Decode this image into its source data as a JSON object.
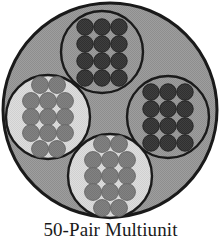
{
  "figure": {
    "caption": "50-Pair Multiunit"
  },
  "colors": {
    "page_background": "#ffffff",
    "outline": "#1a1a1a",
    "jacket_fill": "#9a9a9a",
    "bundle_fill_dark": "#9a9a9a",
    "bundle_fill_light": "#d9d9d9",
    "conductor_dark": "#3c3c3c",
    "conductor_medium": "#7e7e7e",
    "caption_text": "#1a1a1a"
  },
  "cable": {
    "label": "cable-cross-section",
    "outer": {
      "cx": 110,
      "cy": 110,
      "r": 107,
      "stroke_width": 3
    },
    "bundle_count": 4,
    "bundles": [
      {
        "name": "top-bundle",
        "position": "top",
        "cx": 102,
        "cy": 52,
        "r": 41,
        "fill": "#9a9a9a",
        "dot_fill": "#3c3c3c",
        "dot_r": 8.2,
        "columns": 3,
        "rows": 4,
        "dot_count": 12,
        "dots": [
          [
            -17,
            -25
          ],
          [
            0,
            -25
          ],
          [
            17,
            -25
          ],
          [
            -17,
            -8
          ],
          [
            0,
            -8
          ],
          [
            17,
            -8
          ],
          [
            -17,
            9
          ],
          [
            0,
            9
          ],
          [
            17,
            9
          ],
          [
            -17,
            26
          ],
          [
            0,
            26
          ],
          [
            17,
            26
          ]
        ]
      },
      {
        "name": "right-bundle",
        "position": "right",
        "cx": 168,
        "cy": 117,
        "r": 41,
        "fill": "#9a9a9a",
        "dot_fill": "#3c3c3c",
        "dot_r": 8.2,
        "columns": 3,
        "rows": 4,
        "dot_count": 12,
        "dots": [
          [
            -17,
            -25
          ],
          [
            0,
            -25
          ],
          [
            17,
            -25
          ],
          [
            -17,
            -8
          ],
          [
            0,
            -8
          ],
          [
            17,
            -8
          ],
          [
            -17,
            9
          ],
          [
            0,
            9
          ],
          [
            17,
            9
          ],
          [
            -17,
            26
          ],
          [
            0,
            26
          ],
          [
            17,
            26
          ]
        ]
      },
      {
        "name": "left-bundle",
        "position": "left",
        "cx": 48,
        "cy": 117,
        "r": 42,
        "fill": "#d9d9d9",
        "dot_fill": "#7e7e7e",
        "dot_r": 8.4,
        "columns": 3,
        "rows": 5,
        "dot_count": 13,
        "dots": [
          [
            -8,
            -32
          ],
          [
            9,
            -32
          ],
          [
            -17,
            -16
          ],
          [
            0,
            -16
          ],
          [
            17,
            -16
          ],
          [
            -17,
            0
          ],
          [
            0,
            0
          ],
          [
            17,
            0
          ],
          [
            -17,
            16
          ],
          [
            0,
            16
          ],
          [
            17,
            16
          ],
          [
            -8,
            32
          ],
          [
            9,
            32
          ]
        ]
      },
      {
        "name": "bottom-bundle",
        "position": "bottom",
        "cx": 110,
        "cy": 176,
        "r": 42,
        "fill": "#d9d9d9",
        "dot_fill": "#7e7e7e",
        "dot_r": 8.4,
        "columns": 3,
        "rows": 5,
        "dot_count": 13,
        "dots": [
          [
            -8,
            -32
          ],
          [
            9,
            -32
          ],
          [
            -17,
            -16
          ],
          [
            0,
            -16
          ],
          [
            17,
            -16
          ],
          [
            -17,
            0
          ],
          [
            0,
            0
          ],
          [
            17,
            0
          ],
          [
            -17,
            16
          ],
          [
            0,
            16
          ],
          [
            17,
            16
          ],
          [
            -8,
            32
          ],
          [
            9,
            32
          ]
        ]
      }
    ]
  }
}
